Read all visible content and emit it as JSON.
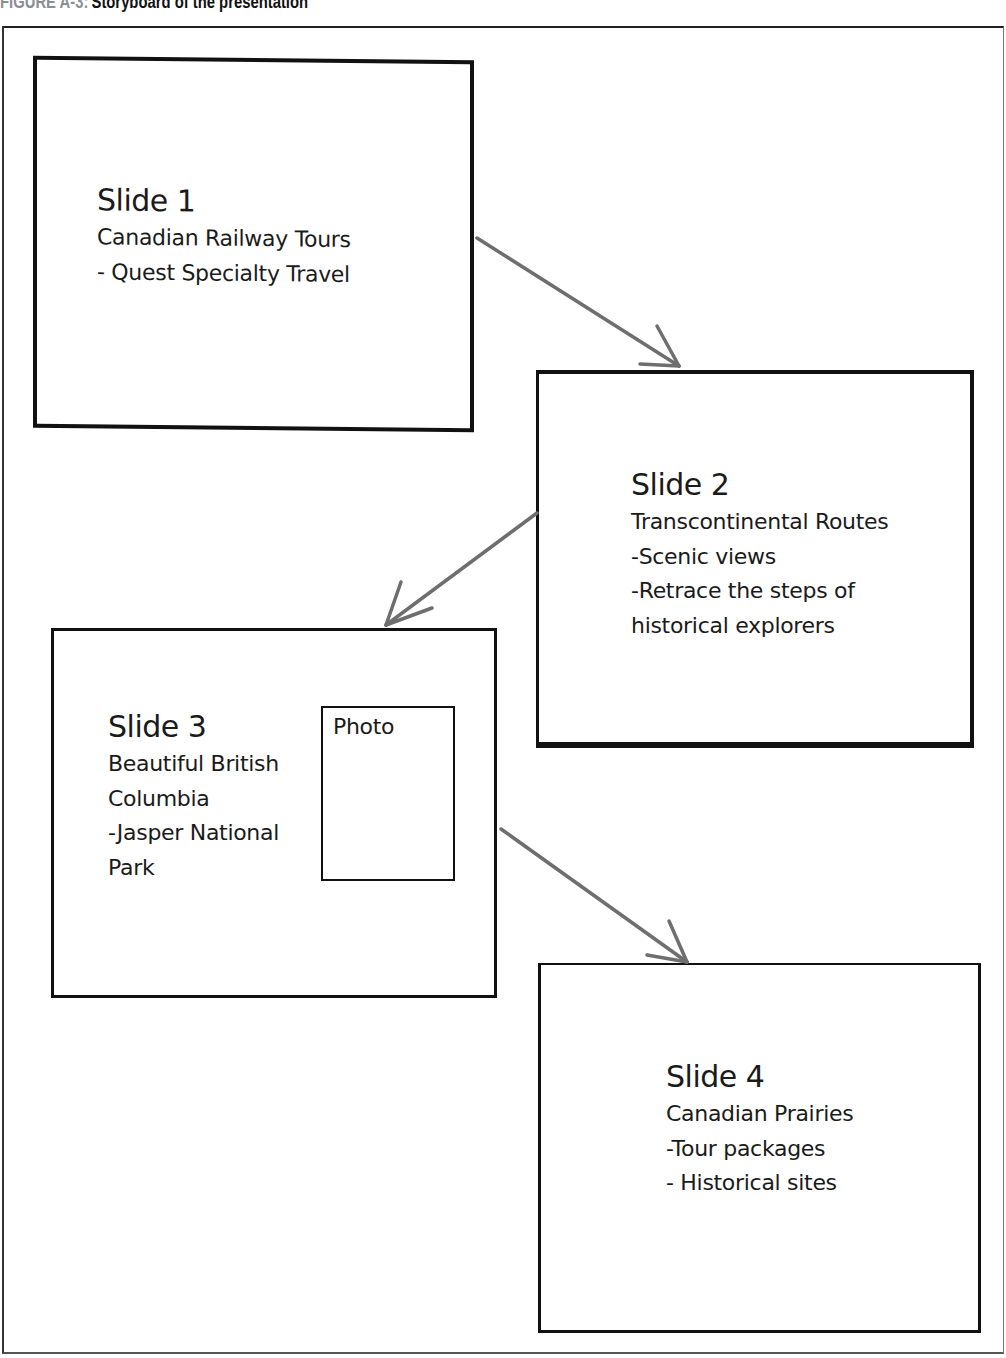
{
  "caption": {
    "label": "FIGURE A-3:",
    "title": "Storyboard of the presentation"
  },
  "colors": {
    "caption_label": "#8a8f96",
    "box_border": "#111111",
    "arrow": "#6e6e6e",
    "background": "#ffffff"
  },
  "slides": [
    {
      "title": "Slide 1",
      "lines": [
        "Canadian Railway Tours",
        "- Quest Specialty Travel"
      ]
    },
    {
      "title": "Slide 2",
      "lines": [
        "Transcontinental Routes",
        "-Scenic views",
        "-Retrace the steps of",
        "historical explorers"
      ]
    },
    {
      "title": "Slide 3",
      "lines": [
        "Beautiful British",
        "Columbia",
        "-Jasper National",
        "Park"
      ],
      "placeholder": "Photo"
    },
    {
      "title": "Slide 4",
      "lines": [
        "Canadian Prairies",
        "-Tour packages",
        "- Historical sites"
      ]
    }
  ],
  "arrows": [
    {
      "from": "Slide 1",
      "to": "Slide 2",
      "icon": "arrow-down-right-icon"
    },
    {
      "from": "Slide 2",
      "to": "Slide 3",
      "icon": "arrow-down-left-icon"
    },
    {
      "from": "Slide 3",
      "to": "Slide 4",
      "icon": "arrow-down-right-icon"
    }
  ]
}
